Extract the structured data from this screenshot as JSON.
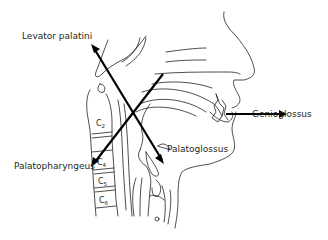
{
  "figure": {
    "type": "sagittal-head-neck-muscle-diagram",
    "background": "#ffffff",
    "line_color": "#231f20",
    "arrow_color": "#000000"
  },
  "labels": {
    "levator_palatini": "Levator palatini",
    "genioglossus": "Genioglossus",
    "palatopharyngeus": "Palatopharyngeus",
    "palatoglossus": "Palatoglossus"
  },
  "vertebrae": [
    {
      "letter": "C",
      "num": "2"
    },
    {
      "letter": "C",
      "num": "4"
    },
    {
      "letter": "C",
      "num": "5"
    },
    {
      "letter": "C",
      "num": "6"
    }
  ],
  "arrows": [
    {
      "name": "levator-palatini-arrow",
      "from": [
        162,
        160
      ],
      "to": [
        92,
        45
      ]
    },
    {
      "name": "palatopharyngeus-arrow",
      "from": [
        163,
        74
      ],
      "to": [
        92,
        166
      ]
    },
    {
      "name": "genioglossus-arrow",
      "from": [
        226,
        114
      ],
      "to": [
        286,
        114
      ]
    }
  ]
}
